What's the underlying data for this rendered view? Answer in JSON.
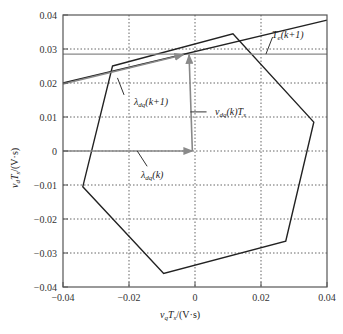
{
  "chart_data": {
    "type": "line",
    "title": "",
    "xlabel": "v_q T_s/(V·s)",
    "ylabel": "v_d T_s/(V·s)",
    "xlim": [
      -0.04,
      0.04
    ],
    "ylim": [
      -0.04,
      0.04
    ],
    "grid": true,
    "grid_style": "dotted",
    "x_ticks": [
      -0.04,
      -0.02,
      0,
      0.02,
      0.04
    ],
    "x_tick_labels": [
      "−0.04",
      "−0.02",
      "0",
      "0.02",
      "0.04"
    ],
    "y_ticks": [
      -0.04,
      -0.03,
      -0.02,
      -0.01,
      0,
      0.01,
      0.02,
      0.03,
      0.04
    ],
    "y_tick_labels": [
      "−0.04",
      "−0.03",
      "−0.02",
      "−0.01",
      "0",
      "0.01",
      "0.02",
      "0.03",
      "0.04"
    ],
    "series": [
      {
        "name": "voltage-hexagon",
        "kind": "closed-polygon",
        "color": "#222222",
        "points": [
          [
            -0.025,
            0.025
          ],
          [
            0.0115,
            0.0345
          ],
          [
            0.036,
            0.0085
          ],
          [
            0.0275,
            -0.0265
          ],
          [
            -0.0095,
            -0.036
          ],
          [
            -0.034,
            -0.0105
          ]
        ]
      },
      {
        "name": "Te(k+1) level line",
        "kind": "horizontal-line",
        "color": "#888888",
        "y": 0.0285
      },
      {
        "name": "torque boundary",
        "kind": "line",
        "color": "#222222",
        "points": [
          [
            -0.04,
            0.02
          ],
          [
            0.04,
            0.0385
          ]
        ]
      }
    ],
    "arrows": [
      {
        "name": "lambda_dq(k)",
        "from": [
          -0.04,
          0.0
        ],
        "to": [
          -0.0008,
          0.0
        ],
        "color": "#888888"
      },
      {
        "name": "v_dq(k)Ts",
        "from": [
          -0.0008,
          0.0
        ],
        "to": [
          -0.0018,
          0.0283
        ],
        "color": "#888888"
      },
      {
        "name": "lambda_dq(k+1)",
        "from": [
          -0.04,
          0.0197
        ],
        "to": [
          -0.0035,
          0.0283
        ],
        "color": "#888888"
      }
    ],
    "annotations": [
      {
        "text": "T_e(k+1)",
        "at": [
          0.024,
          0.0355
        ],
        "leader_to": [
          0.0215,
          0.0285
        ]
      },
      {
        "text": "λ_dq(k+1)",
        "at": [
          -0.021,
          0.0145
        ],
        "leader_to": [
          -0.0235,
          0.0215
        ]
      },
      {
        "text": "v_dq(k)T_s",
        "at": [
          0.005,
          0.0115
        ],
        "leader_to": [
          -0.0014,
          0.0115
        ]
      },
      {
        "text": "λ_dq(k)",
        "at": [
          -0.016,
          -0.0065
        ],
        "leader_to": [
          -0.0175,
          0.0
        ]
      }
    ]
  },
  "labels": {
    "x_axis": {
      "main": "v",
      "sub1": "q",
      "mid": "T",
      "sub2": "s",
      "unit": "/(V·s)"
    },
    "y_axis": {
      "main": "v",
      "sub1": "d",
      "mid": "T",
      "sub2": "s",
      "unit": "/(V·s)"
    },
    "te": {
      "main": "T",
      "sub": "e",
      "rest": "(k+1)"
    },
    "lambda_next": {
      "main": "λ",
      "sub": "dq",
      "rest": "(k+1)"
    },
    "vdq": {
      "main": "v",
      "sub": "dq",
      "rest": "(k)T",
      "sub2": "s"
    },
    "lambda_now": {
      "main": "λ",
      "sub": "dq",
      "rest": "(k)"
    }
  }
}
